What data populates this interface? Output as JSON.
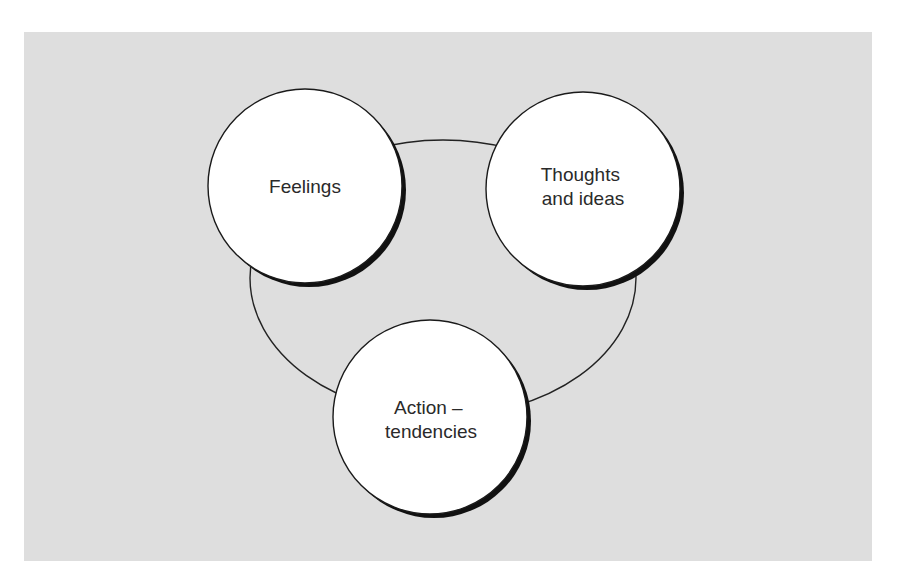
{
  "diagram": {
    "type": "cycle",
    "background_color": "#dedede",
    "nodes": [
      {
        "id": "feelings",
        "label_lines": [
          "Feelings"
        ]
      },
      {
        "id": "thoughts",
        "label_lines": [
          "Thoughts",
          "and ideas"
        ]
      },
      {
        "id": "action",
        "label_lines": [
          "Action –",
          "tendencies"
        ]
      }
    ],
    "connector": "ellipse linking all three nodes"
  }
}
